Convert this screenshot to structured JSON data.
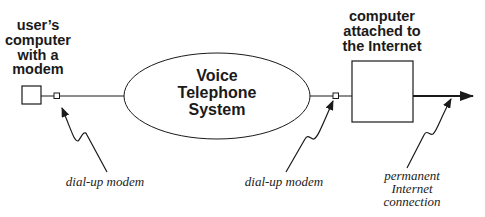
{
  "diagram": {
    "user_computer_label": [
      "user’s",
      "computer",
      "with a",
      "modem"
    ],
    "voice_system_label": [
      "Voice",
      "Telephone",
      "System"
    ],
    "internet_computer_label": [
      "computer",
      "attached to",
      "the Internet"
    ],
    "annotations": {
      "left_modem": "dial-up modem",
      "right_modem": "dial-up modem",
      "internet_connection": [
        "permanent",
        "Internet",
        "connection"
      ]
    },
    "colors": {
      "stroke": "#1a1a1a",
      "background": "#ffffff"
    }
  }
}
